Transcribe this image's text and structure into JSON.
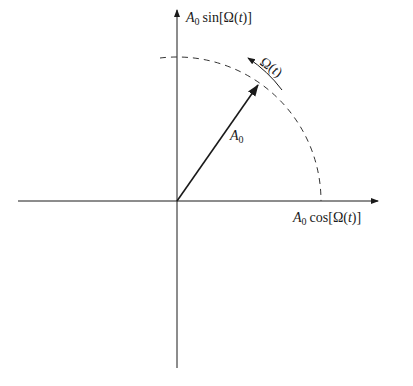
{
  "diagram": {
    "type": "phasor",
    "y_axis_label": {
      "amp": "A",
      "sub": "0",
      "func": "sin[Ω(",
      "var": "t",
      "close": ")]"
    },
    "x_axis_label": {
      "amp": "A",
      "sub": "0",
      "func": "cos[Ω(",
      "var": "t",
      "close": ")]"
    },
    "vector_label": {
      "amp": "A",
      "sub": "0"
    },
    "rotation_label": {
      "sym": "Ω(",
      "var": "t",
      "close": ")"
    },
    "colors": {
      "line": "#1a1a1a",
      "dashed": "#333333"
    }
  }
}
